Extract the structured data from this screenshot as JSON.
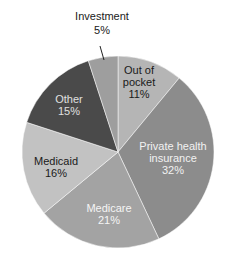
{
  "chart_data": {
    "type": "pie",
    "title": "",
    "start_angle_deg": 0,
    "direction": "clockwise",
    "slices": [
      {
        "label": "Out of pocket",
        "value": 11,
        "pct_text": "11%",
        "color": "#b5b5b5",
        "text_color": "#1a1a1a"
      },
      {
        "label": "Private health insurance",
        "value": 32,
        "pct_text": "32%",
        "color": "#8c8c8c",
        "text_color": "#f2f2f2"
      },
      {
        "label": "Medicare",
        "value": 21,
        "pct_text": "21%",
        "color": "#a3a3a3",
        "text_color": "#f5f5f5"
      },
      {
        "label": "Medicaid",
        "value": 16,
        "pct_text": "16%",
        "color": "#c2c2c2",
        "text_color": "#1a1a1a"
      },
      {
        "label": "Other",
        "value": 15,
        "pct_text": "15%",
        "color": "#4a4a4a",
        "text_color": "#e0e0e0"
      },
      {
        "label": "Investment",
        "value": 5,
        "pct_text": "5%",
        "color": "#9e9e9e",
        "text_color": "#1a1a1a"
      }
    ]
  },
  "labels": {
    "investment": {
      "line1": "Investment",
      "line2": "5%"
    },
    "out_of_pocket": {
      "line1": "Out of",
      "line2": "pocket",
      "line3": "11%"
    },
    "other": {
      "line1": "Other",
      "line2": "15%"
    },
    "private": {
      "line1": "Private health",
      "line2": "insurance",
      "line3": "32%"
    },
    "medicaid": {
      "line1": "Medicaid",
      "line2": "16%"
    },
    "medicare": {
      "line1": "Medicare",
      "line2": "21%"
    }
  }
}
